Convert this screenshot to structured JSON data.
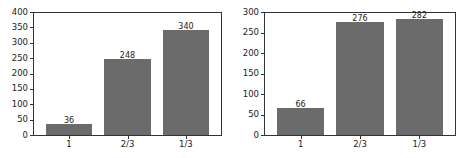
{
  "chart_data": [
    {
      "type": "bar",
      "title": "",
      "xlabel": "",
      "ylabel": "",
      "categories": [
        "1",
        "2/3",
        "1/3"
      ],
      "values": [
        36,
        248,
        340
      ],
      "ylim": [
        0,
        400
      ],
      "yticks": [
        0,
        50,
        100,
        150,
        200,
        250,
        300,
        350,
        400
      ],
      "bar_color": "#6b6b6b",
      "grid": false,
      "data_labels": true
    },
    {
      "type": "bar",
      "title": "",
      "xlabel": "",
      "ylabel": "",
      "categories": [
        "1",
        "2/3",
        "1/3"
      ],
      "values": [
        66,
        276,
        282
      ],
      "ylim": [
        0,
        300
      ],
      "yticks": [
        0,
        50,
        100,
        150,
        200,
        250,
        300
      ],
      "bar_color": "#6b6b6b",
      "grid": false,
      "data_labels": true
    }
  ]
}
